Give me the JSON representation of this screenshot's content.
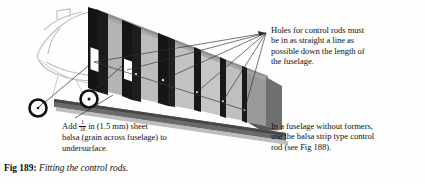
{
  "figure": {
    "caption_label": "Fig 189:",
    "caption_text": "Fitting the control rods."
  },
  "callouts": {
    "holes": {
      "name": "holes-for-control-rods-note",
      "lines": [
        "Holes for control rods must",
        "be in as straight a line as",
        "possible down the length of",
        "the fuselage."
      ]
    },
    "formers": {
      "name": "fuselage-without-formers-note",
      "lines": [
        "In a fuselage without formers,",
        "use the balsa strip type control",
        "rod (see Fig 188)."
      ]
    },
    "balsa": {
      "name": "add-balsa-sheet-note",
      "line1_pre": "Add ",
      "fraction_numerator": "1",
      "fraction_denominator": "16",
      "line1_post": " in (1.5 mm) sheet",
      "line2": "balsa (grain across fuselage) to",
      "line3": "undersurface."
    }
  },
  "illustration": {
    "name": "fuselage-cutaway-drawing",
    "description": "Perspective drawing of a model aircraft fuselage with formers, control rod holes and balsa undersurface",
    "colors": {
      "former_dark": "#141414",
      "side_panel_gray": "#a8a8a8",
      "side_panel_light": "#c9c9c9",
      "undersurface_gray": "#5c5c5c",
      "nose_outline": "#b9b9b9",
      "leader_line": "#2a2a2a",
      "hole_white": "#ffffff",
      "background": "#fefefe"
    },
    "detail_circles": [
      {
        "name": "hole-detail-circle-left",
        "cx": 38,
        "cy": 108,
        "r": 9
      },
      {
        "name": "hole-detail-circle-right",
        "cx": 89,
        "cy": 99,
        "r": 9
      }
    ],
    "leader_convergence": {
      "x": 267,
      "y": 33
    }
  }
}
